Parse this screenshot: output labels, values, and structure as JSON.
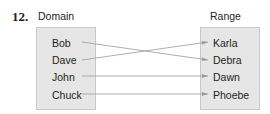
{
  "problem_number": "12.",
  "domain": {
    "title": "Domain",
    "items": [
      "Bob",
      "Dave",
      "John",
      "Chuck"
    ]
  },
  "range": {
    "title": "Range",
    "items": [
      "Karla",
      "Debra",
      "Dawn",
      "Phoebe"
    ]
  },
  "mappings": [
    {
      "from": "Bob",
      "to": "Debra"
    },
    {
      "from": "Dave",
      "to": "Karla"
    },
    {
      "from": "John",
      "to": "Dawn"
    },
    {
      "from": "Chuck",
      "to": "Phoebe"
    }
  ],
  "colors": {
    "box_fill": "#e6e6e6",
    "box_border": "#c8c8c8",
    "arrow": "#9a9a9a",
    "text": "#231f20"
  }
}
